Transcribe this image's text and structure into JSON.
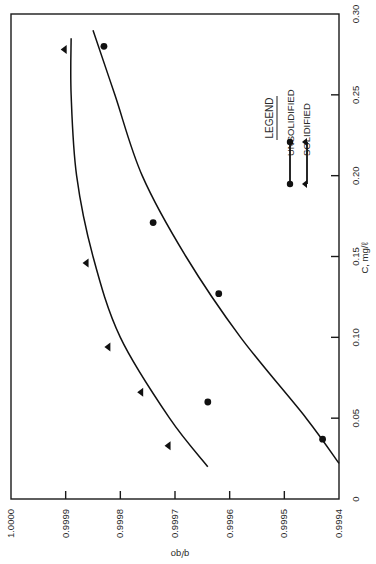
{
  "chart_data": {
    "type": "scatter",
    "orientation": "rotated 90 degrees counter-clockwise on page (x-axis runs vertically on right edge, y-axis runs horizontally along bottom)",
    "title": "",
    "xlabel": "C, mg/ℓ",
    "ylabel": "q/qo",
    "xlim": [
      0,
      0.3
    ],
    "ylim": [
      0.9994,
      1.0
    ],
    "x_ticks": [
      "0",
      "0.05",
      "0.10",
      "0.15",
      "0.20",
      "0.25",
      "0.30"
    ],
    "y_ticks": [
      "1.0000",
      "0.9999",
      "0.9998",
      "0.9997",
      "0.9996",
      "0.9995",
      "0.9994"
    ],
    "grid": false,
    "legend": {
      "title": "LEGEND",
      "position": "upper-right of plot (rotated)",
      "entries": [
        "UNSOLIDIFIED",
        "SOLIDIFIED"
      ]
    },
    "series": [
      {
        "name": "UNSOLIDIFIED",
        "marker": "circle",
        "points": [
          {
            "x": 0.037,
            "y": 0.99943
          },
          {
            "x": 0.06,
            "y": 0.99964
          },
          {
            "x": 0.127,
            "y": 0.99962
          },
          {
            "x": 0.171,
            "y": 0.99974
          },
          {
            "x": 0.28,
            "y": 0.99983
          }
        ],
        "fit_curve": [
          {
            "x": 0.022,
            "y": 0.9994
          },
          {
            "x": 0.05,
            "y": 0.99946
          },
          {
            "x": 0.1,
            "y": 0.99958
          },
          {
            "x": 0.15,
            "y": 0.99968
          },
          {
            "x": 0.2,
            "y": 0.99976
          },
          {
            "x": 0.25,
            "y": 0.99981
          },
          {
            "x": 0.29,
            "y": 0.99985
          }
        ]
      },
      {
        "name": "SOLIDIFIED",
        "marker": "triangle",
        "points": [
          {
            "x": 0.033,
            "y": 0.99971
          },
          {
            "x": 0.066,
            "y": 0.99976
          },
          {
            "x": 0.094,
            "y": 0.99982
          },
          {
            "x": 0.146,
            "y": 0.99986
          },
          {
            "x": 0.278,
            "y": 0.9999
          }
        ],
        "fit_curve": [
          {
            "x": 0.02,
            "y": 0.99964
          },
          {
            "x": 0.05,
            "y": 0.99971
          },
          {
            "x": 0.1,
            "y": 0.9998
          },
          {
            "x": 0.15,
            "y": 0.99985
          },
          {
            "x": 0.2,
            "y": 0.99988
          },
          {
            "x": 0.25,
            "y": 0.99989
          },
          {
            "x": 0.285,
            "y": 0.99989
          }
        ]
      }
    ]
  },
  "layout": {
    "plot_px": {
      "left": 11,
      "right": 339,
      "top": 14,
      "bottom": 499
    },
    "line_color": "#111111",
    "text_color": "#2a2a2a"
  }
}
